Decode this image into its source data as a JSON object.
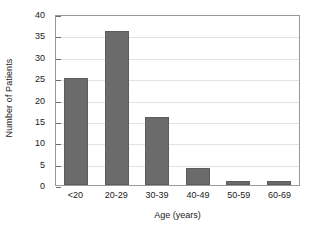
{
  "chart_data": {
    "type": "bar",
    "title": "",
    "subtitle": "",
    "categories": [
      "<20",
      "20-29",
      "30-39",
      "40-49",
      "50-59",
      "60-69"
    ],
    "values": [
      25,
      36,
      16,
      4,
      1,
      1
    ],
    "xlabel": "Age (years)",
    "ylabel": "Number of Patients",
    "ylim": [
      0,
      40
    ],
    "ytick_step": 5,
    "yticks": [
      0,
      5,
      10,
      15,
      20,
      25,
      30,
      35,
      40
    ],
    "ytick_labels": [
      "0",
      "5",
      "10",
      "15",
      "20",
      "25",
      "30",
      "35",
      "40"
    ],
    "grid": true,
    "grid_axis": "y",
    "legend": false,
    "legend_position": "none",
    "annotations": [],
    "colors": {
      "bar_fill": "#6b6b6b",
      "bar_edge": "#5c5c5c",
      "gridline": "#e2e2e2",
      "frame": "#9a9a9a",
      "tick_mark": "#6f6f6f",
      "text": "#1a1a1a",
      "background": "#ffffff"
    }
  }
}
